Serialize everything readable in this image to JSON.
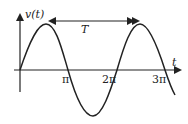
{
  "diagram": {
    "y_axis_label": "v(t)",
    "x_axis_label": "t",
    "period_label": "T",
    "tick_labels": [
      "π",
      "2π",
      "3π"
    ],
    "curve": "sine wave",
    "colors": {
      "stroke": "#222222",
      "background": "#ffffff"
    }
  }
}
